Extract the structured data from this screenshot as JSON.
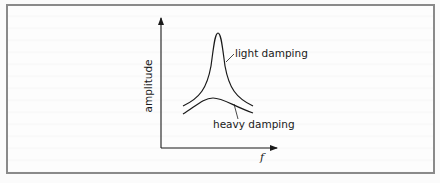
{
  "diagram": {
    "y_axis_label": "amplitude",
    "x_axis_label": "f",
    "curves": [
      {
        "name": "light damping",
        "label": "light damping",
        "shape": "sharp tall peak"
      },
      {
        "name": "heavy damping",
        "label": "heavy damping",
        "shape": "low broad peak"
      }
    ],
    "colors": {
      "line": "#1a1a1a",
      "frame": "#8a8a8a",
      "background": "#fbfbfb"
    }
  }
}
